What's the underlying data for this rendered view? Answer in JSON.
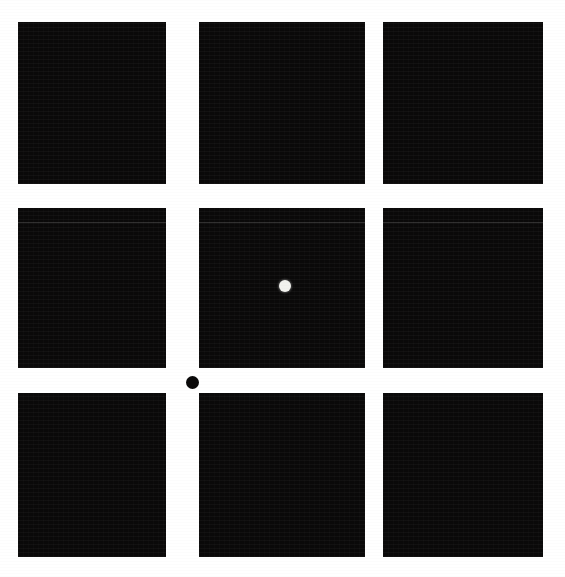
{
  "figure": {
    "title": "",
    "caption": "",
    "background_color": "#ffffff",
    "panel_color": "#0a0909",
    "canvas": {
      "width_px": 565,
      "height_px": 577
    },
    "layout": {
      "type": "grid",
      "rows": 3,
      "columns": 3,
      "panel_count": 9,
      "column_left_px": [
        18,
        199,
        383
      ],
      "column_width_px": [
        148,
        166,
        160
      ],
      "row_top_px": [
        22,
        208,
        393
      ],
      "row_height_px": [
        162,
        160,
        164
      ],
      "horizontal_gutter_px": 25,
      "vertical_gutter_px": 25
    },
    "panels": [
      {
        "id": "panel-r1c1",
        "row": 1,
        "col": 1,
        "label": "",
        "fill": "#0a0909",
        "has_band": false,
        "markers": []
      },
      {
        "id": "panel-r1c2",
        "row": 1,
        "col": 2,
        "label": "",
        "fill": "#0a0909",
        "has_band": false,
        "markers": []
      },
      {
        "id": "panel-r1c3",
        "row": 1,
        "col": 3,
        "label": "",
        "fill": "#0a0909",
        "has_band": false,
        "markers": []
      },
      {
        "id": "panel-r2c1",
        "row": 2,
        "col": 1,
        "label": "",
        "fill": "#0a0909",
        "has_band": true,
        "band_offset_px": 14,
        "markers": []
      },
      {
        "id": "panel-r2c2",
        "row": 2,
        "col": 2,
        "label": "",
        "fill": "#0a0909",
        "has_band": true,
        "band_offset_px": 14,
        "markers": [
          {
            "id": "white-dot",
            "shape": "circle",
            "color": "#f2f2ee",
            "diameter_px": 12,
            "center_x_px": 86,
            "center_y_px": 78
          }
        ]
      },
      {
        "id": "panel-r2c3",
        "row": 2,
        "col": 3,
        "label": "",
        "fill": "#0a0909",
        "has_band": true,
        "band_offset_px": 14,
        "markers": []
      },
      {
        "id": "panel-r3c1",
        "row": 3,
        "col": 1,
        "label": "",
        "fill": "#0a0909",
        "has_band": false,
        "markers": []
      },
      {
        "id": "panel-r3c2",
        "row": 3,
        "col": 2,
        "label": "",
        "fill": "#0a0909",
        "has_band": false,
        "markers": []
      },
      {
        "id": "panel-r3c3",
        "row": 3,
        "col": 3,
        "label": "",
        "fill": "#0a0909",
        "has_band": false,
        "markers": []
      }
    ],
    "overlay_markers": [
      {
        "id": "gutter-black-dot",
        "shape": "circle",
        "color": "#0a0909",
        "diameter_px": 13,
        "center_x_px": 192,
        "center_y_px": 382,
        "location": "gutter between middle and bottom rows, below center panel"
      }
    ]
  }
}
